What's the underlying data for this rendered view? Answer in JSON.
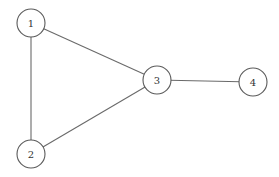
{
  "diagram": {
    "type": "undirected-graph",
    "colors": {
      "background": "#ffffff",
      "stroke": "#5a5a5a",
      "edge": "#6a6a6a",
      "label": "#333333"
    },
    "node_radius": 14,
    "nodes": [
      {
        "id": "1",
        "label": "1",
        "x": 31,
        "y": 23
      },
      {
        "id": "2",
        "label": "2",
        "x": 31,
        "y": 154
      },
      {
        "id": "3",
        "label": "3",
        "x": 157,
        "y": 80
      },
      {
        "id": "4",
        "label": "4",
        "x": 253,
        "y": 82
      }
    ],
    "edges": [
      {
        "from": "1",
        "to": "2"
      },
      {
        "from": "1",
        "to": "3"
      },
      {
        "from": "2",
        "to": "3"
      },
      {
        "from": "3",
        "to": "4"
      }
    ]
  }
}
